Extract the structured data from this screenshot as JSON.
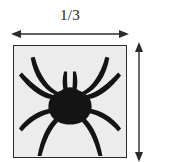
{
  "figure": {
    "type": "dimensioned-square-with-spider",
    "width_label": "1/3",
    "height_label": "",
    "box": {
      "fill_color": "#ececec",
      "border_color": "#2b2b2b",
      "width_px": 114,
      "height_px": 113
    },
    "illustration": {
      "name": "spider-icon",
      "color": "#141414",
      "leg_pairs": 4,
      "description": "black spider silhouette, symmetric, four legs per side"
    },
    "dimension_arrows": {
      "width": {
        "name": "width-dimension-arrow",
        "orientation": "horizontal",
        "double_headed": true,
        "color": "#2b2b2b"
      },
      "height": {
        "name": "height-dimension-arrow",
        "orientation": "vertical",
        "double_headed": true,
        "color": "#2b2b2b"
      }
    }
  }
}
